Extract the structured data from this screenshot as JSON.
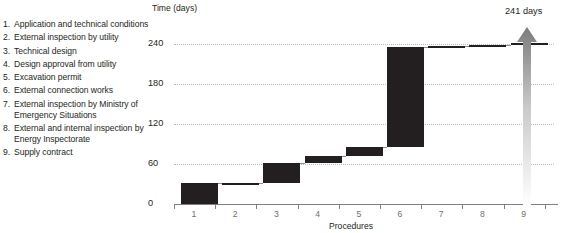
{
  "legend": {
    "items": [
      {
        "num": "1.",
        "label": "Application and technical conditions"
      },
      {
        "num": "2.",
        "label": "External inspection by utility"
      },
      {
        "num": "3.",
        "label": "Technical design"
      },
      {
        "num": "4.",
        "label": "Design approval from utility"
      },
      {
        "num": "5.",
        "label": "Excavation permit"
      },
      {
        "num": "6.",
        "label": "External connection works"
      },
      {
        "num": "7.",
        "label": "External inspection by Ministry of Emergency Situations"
      },
      {
        "num": "8.",
        "label": "External and internal inspection by Energy Inspectorate"
      },
      {
        "num": "9.",
        "label": "Supply contract"
      }
    ]
  },
  "annotation": {
    "total_label": "241 days",
    "arrow_icon": "up-arrow-icon"
  },
  "chart_data": {
    "type": "bar",
    "subtype": "waterfall",
    "title": "",
    "ylabel": "Time (days)",
    "xlabel": "Procedures",
    "ylim": [
      0,
      240
    ],
    "yticks": [
      0,
      60,
      120,
      180,
      240
    ],
    "ytick_labels": [
      "0",
      "60",
      "120",
      "180",
      "240"
    ],
    "grid": true,
    "legend_position": "left",
    "categories": [
      "1",
      "2",
      "3",
      "4",
      "5",
      "6",
      "7",
      "8",
      "9"
    ],
    "values": [
      31,
      1,
      30,
      10,
      14,
      150,
      1,
      1,
      3
    ],
    "cumulative_start": [
      0,
      31,
      32,
      62,
      72,
      86,
      236,
      237,
      238
    ],
    "cumulative_end": [
      31,
      32,
      62,
      72,
      86,
      236,
      237,
      238,
      241
    ],
    "total": 241,
    "bar_color": "#231f20",
    "connector_color": "#8c8c8c",
    "gridline_color": "#b9b9b9"
  }
}
